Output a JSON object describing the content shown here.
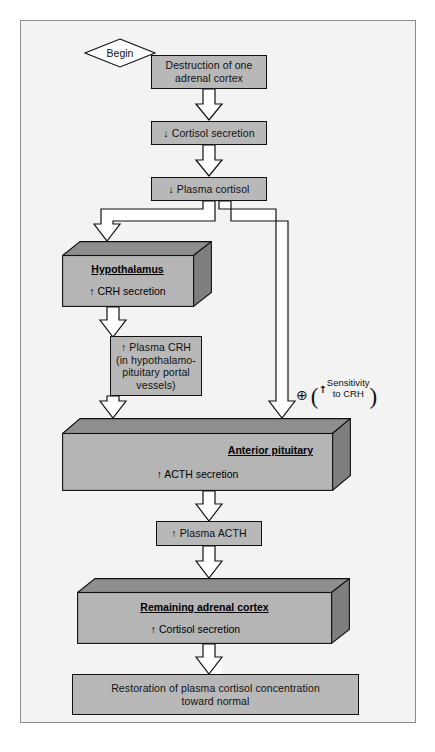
{
  "diagram": {
    "start_label": "Begin",
    "colors": {
      "box_fill": "#b8b8b8",
      "box_fill_light": "#c4c4c4",
      "box_3d_front": "#b5b5b5",
      "box_3d_top": "#8e8e8e",
      "box_3d_side": "#7e7e7e",
      "outline": "#111111",
      "page_background": "#f3f3f3",
      "frame_border": "#8d8d8d",
      "arrow_fill": "#ffffff",
      "arrow_outline": "#111111"
    },
    "nodes": [
      {
        "id": "destruction",
        "type": "flat-box",
        "text": "Destruction of one\nadrenal cortex"
      },
      {
        "id": "cortisol-secretion-down",
        "type": "flat-box",
        "text": "↓ Cortisol secretion"
      },
      {
        "id": "plasma-cortisol-down",
        "type": "flat-box",
        "text": "↓ Plasma cortisol"
      },
      {
        "id": "hypothalamus",
        "type": "box-3d",
        "title": "Hypothalamus",
        "subtext": "↑ CRH secretion"
      },
      {
        "id": "plasma-crh",
        "type": "flat-box",
        "text": "↑ Plasma CRH\n(in hypothalamo-\npituitary portal\nvessels)"
      },
      {
        "id": "anterior-pituitary",
        "type": "box-3d",
        "title": "Anterior pituitary",
        "subtext": "↑ ACTH secretion"
      },
      {
        "id": "plasma-acth",
        "type": "flat-box",
        "text": "↑ Plasma ACTH"
      },
      {
        "id": "remaining-adrenal-cortex",
        "type": "box-3d",
        "title": "Remaining adrenal cortex",
        "subtext": "↑ Cortisol secretion"
      },
      {
        "id": "restoration",
        "type": "flat-box",
        "text": "Restoration of plasma cortisol concentration\ntoward normal"
      }
    ],
    "annotation": {
      "id": "sensitivity-note",
      "symbol": "⊕",
      "open_paren": "(",
      "close_paren": ")",
      "arrow": "↑",
      "line1": "Sensitivity",
      "line2": "to CRH"
    },
    "node_text": {
      "destruction_line1": "Destruction of one",
      "destruction_line2": "adrenal cortex",
      "cortisol_secretion_down": "↓ Cortisol secretion",
      "plasma_cortisol_down": "↓ Plasma cortisol",
      "hypothalamus_title": "Hypothalamus",
      "hypothalamus_sub": "↑ CRH secretion",
      "plasma_crh_line1": "↑ Plasma CRH",
      "plasma_crh_line2": "(in hypothalamo-",
      "plasma_crh_line3": "pituitary portal",
      "plasma_crh_line4": "vessels)",
      "anterior_pituitary_title": "Anterior pituitary",
      "anterior_pituitary_sub": "↑ ACTH secretion",
      "plasma_acth": "↑ Plasma ACTH",
      "remaining_cortex_title": "Remaining adrenal cortex",
      "remaining_cortex_sub": "↑ Cortisol secretion",
      "restoration_line1": "Restoration of plasma cortisol concentration",
      "restoration_line2": "toward normal"
    },
    "edges": [
      {
        "id": "edge-destruction-to-cortisol",
        "from": "destruction",
        "to": "cortisol-secretion-down"
      },
      {
        "id": "edge-cortisol-to-plasma",
        "from": "cortisol-secretion-down",
        "to": "plasma-cortisol-down"
      },
      {
        "id": "edge-plasma-to-hypothalamus",
        "from": "plasma-cortisol-down",
        "to": "hypothalamus"
      },
      {
        "id": "edge-plasma-to-pituitary",
        "from": "plasma-cortisol-down",
        "to": "anterior-pituitary"
      },
      {
        "id": "edge-hypothalamus-to-crh",
        "from": "hypothalamus",
        "to": "plasma-crh"
      },
      {
        "id": "edge-crh-to-pituitary",
        "from": "plasma-crh",
        "to": "anterior-pituitary"
      },
      {
        "id": "edge-pituitary-to-acth",
        "from": "anterior-pituitary",
        "to": "plasma-acth"
      },
      {
        "id": "edge-acth-to-cortex",
        "from": "plasma-acth",
        "to": "remaining-adrenal-cortex"
      },
      {
        "id": "edge-cortex-to-restoration",
        "from": "remaining-adrenal-cortex",
        "to": "restoration"
      }
    ]
  }
}
